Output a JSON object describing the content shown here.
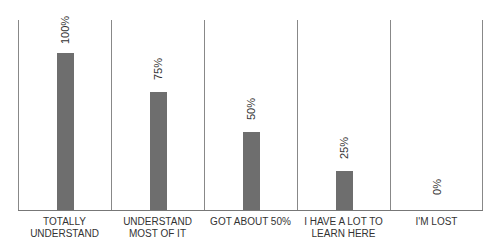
{
  "chart_data": {
    "type": "bar",
    "title": "",
    "categories": [
      "TOTALLY UNDERSTAND",
      "UNDERSTAND MOST OF IT",
      "GOT ABOUT 50%",
      "I HAVE A LOT TO LEARN HERE",
      "I'M LOST"
    ],
    "values": [
      100,
      75,
      50,
      25,
      0
    ],
    "value_labels": [
      "100%",
      "75%",
      "50%",
      "25%",
      "0%"
    ],
    "xlabel": "",
    "ylabel": "",
    "ylim": [
      0,
      100
    ],
    "grid": false,
    "bar_color": "#6e6e6e"
  },
  "labels": [
    [
      "TOTALLY",
      "UNDERSTAND"
    ],
    [
      "UNDERSTAND",
      "MOST OF IT"
    ],
    [
      "GOT ABOUT 50%",
      ""
    ],
    [
      "I HAVE A LOT TO",
      "LEARN HERE"
    ],
    [
      "I'M LOST",
      ""
    ]
  ]
}
